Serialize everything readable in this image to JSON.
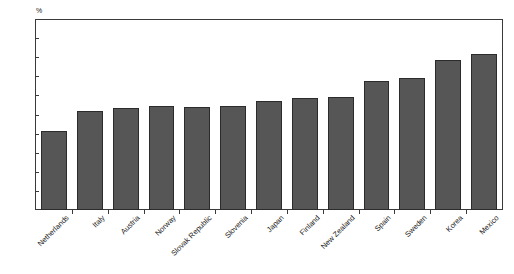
{
  "chart_data": {
    "type": "bar",
    "title": "",
    "xlabel": "",
    "ylabel": "%",
    "unit": "%",
    "ylim": [
      0,
      50
    ],
    "ytick_step": 5,
    "yticks": [
      50,
      45,
      40,
      35,
      30,
      25,
      20,
      15,
      10,
      5,
      0
    ],
    "grid": false,
    "legend": false,
    "orientation": "vertical",
    "bar_color": "#565656",
    "bar_edge_color": "#2b2b2b",
    "categories": [
      "Netherlands",
      "Italy",
      "Austria",
      "Norway",
      "Slovak Republic",
      "Slovenia",
      "Japan",
      "Finland",
      "New Zealand",
      "Spain",
      "Sweden",
      "Korea",
      "Mexico"
    ],
    "values": [
      20.9,
      26.1,
      26.8,
      27.3,
      27.0,
      27.5,
      28.8,
      29.4,
      29.7,
      34.0,
      34.7,
      39.6,
      41.0
    ]
  }
}
